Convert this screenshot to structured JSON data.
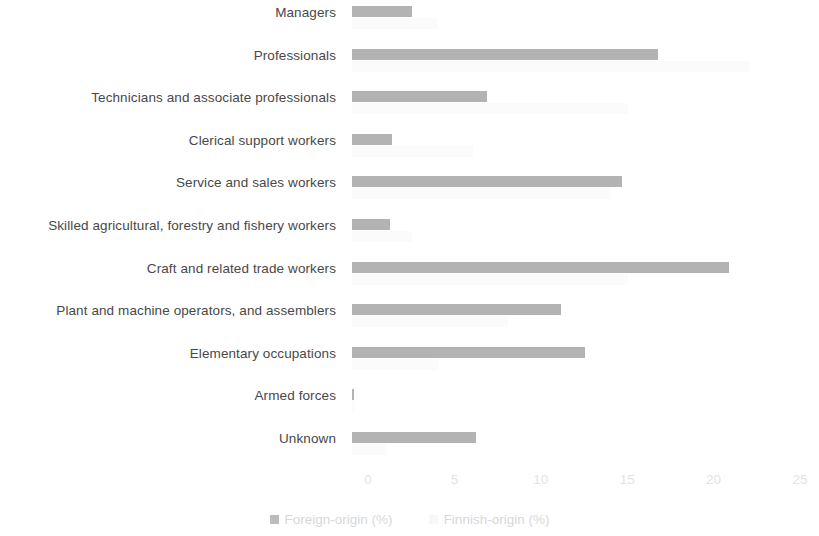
{
  "chart_data": {
    "type": "bar",
    "orientation": "horizontal",
    "title": "",
    "subtitle": "",
    "xlabel": "",
    "ylabel": "",
    "xlim": [
      0,
      25
    ],
    "xticks": [
      0,
      5,
      10,
      15,
      20,
      25
    ],
    "xtick_labels": [
      "0",
      "5",
      "10",
      "15",
      "20",
      "25"
    ],
    "grid": false,
    "legend_position": "bottom",
    "categories": [
      "Managers",
      "Professionals",
      "Technicians and associate professionals",
      "Clerical support workers",
      "Service and sales workers",
      "Skilled agricultural, forestry and fishery workers",
      "Craft and related trade workers",
      "Plant and machine operators, and assemblers",
      "Elementary occupations",
      "Armed forces",
      "Unknown"
    ],
    "series": [
      {
        "name": "Foreign-origin (%)",
        "color": "#b3b3b3",
        "values": [
          3.5,
          17.7,
          7.8,
          2.3,
          15.6,
          2.2,
          21.8,
          12.1,
          13.5,
          0.1,
          7.2
        ]
      },
      {
        "name": "Finnish-origin (%)",
        "color": "#fbfbfb",
        "values": [
          5.0,
          23.0,
          16.0,
          7.0,
          15.0,
          3.5,
          16.0,
          9.0,
          5.0,
          0.2,
          2.0
        ]
      }
    ]
  },
  "legend": {
    "items": [
      {
        "label": "Foreign-origin (%)"
      },
      {
        "label": "Finnish-origin (%)"
      }
    ]
  }
}
